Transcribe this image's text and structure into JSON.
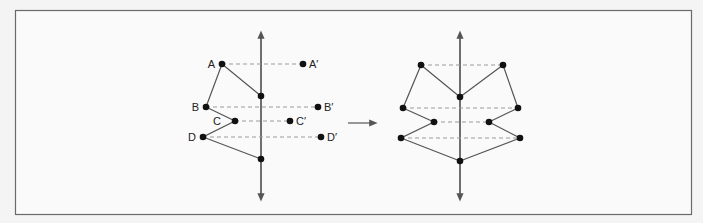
{
  "colors": {
    "background": "#f4f4f4",
    "frame": "#6a6a6a",
    "line": "#555555",
    "dash": "#999999",
    "point": "#111111"
  },
  "left_figure": {
    "axis": {
      "x": 261,
      "y1": 30,
      "y2": 202
    },
    "points": [
      {
        "label": "A",
        "x": 222,
        "y": 64
      },
      {
        "label": "B",
        "x": 206,
        "y": 107
      },
      {
        "label": "C",
        "x": 235,
        "y": 121
      },
      {
        "label": "D",
        "x": 203,
        "y": 137
      }
    ],
    "reflected": [
      {
        "label": "A′",
        "x": 303,
        "y": 64
      },
      {
        "label": "B′",
        "x": 318,
        "y": 107
      },
      {
        "label": "C′",
        "x": 290,
        "y": 121
      },
      {
        "label": "D′",
        "x": 321,
        "y": 137
      }
    ],
    "axis_points": [
      {
        "x": 261,
        "y": 96
      },
      {
        "x": 261,
        "y": 159
      }
    ]
  },
  "arrow": {
    "x1": 348,
    "x2": 378,
    "y": 123
  },
  "right_figure": {
    "axis": {
      "x": 460,
      "y1": 30,
      "y2": 202
    },
    "left_points": [
      {
        "x": 421,
        "y": 65
      },
      {
        "x": 403,
        "y": 108
      },
      {
        "x": 434,
        "y": 122
      },
      {
        "x": 401,
        "y": 138
      }
    ],
    "right_points": [
      {
        "x": 503,
        "y": 65
      },
      {
        "x": 518,
        "y": 108
      },
      {
        "x": 489,
        "y": 122
      },
      {
        "x": 520,
        "y": 138
      }
    ],
    "axis_points": [
      {
        "x": 460,
        "y": 97
      },
      {
        "x": 460,
        "y": 161
      }
    ]
  }
}
